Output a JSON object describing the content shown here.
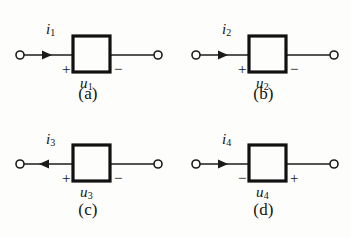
{
  "figure": {
    "background_color": "#fdfdfc",
    "ink_color": "#131313",
    "panels": [
      {
        "caption": "(a)",
        "current_label": "i",
        "current_subscript": "1",
        "current_direction": "right",
        "left_sign": "+",
        "right_sign": "−",
        "voltage_label": "u",
        "voltage_subscript": "1"
      },
      {
        "caption": "(b)",
        "current_label": "i",
        "current_subscript": "2",
        "current_direction": "right",
        "left_sign": "+",
        "right_sign": "−",
        "voltage_label": "u",
        "voltage_subscript": "2"
      },
      {
        "caption": "(c)",
        "current_label": "i",
        "current_subscript": "3",
        "current_direction": "left",
        "left_sign": "+",
        "right_sign": "−",
        "voltage_label": "u",
        "voltage_subscript": "3"
      },
      {
        "caption": "(d)",
        "current_label": "i",
        "current_subscript": "4",
        "current_direction": "right",
        "left_sign": "−",
        "right_sign": "+",
        "voltage_label": "u",
        "voltage_subscript": "4"
      }
    ]
  }
}
